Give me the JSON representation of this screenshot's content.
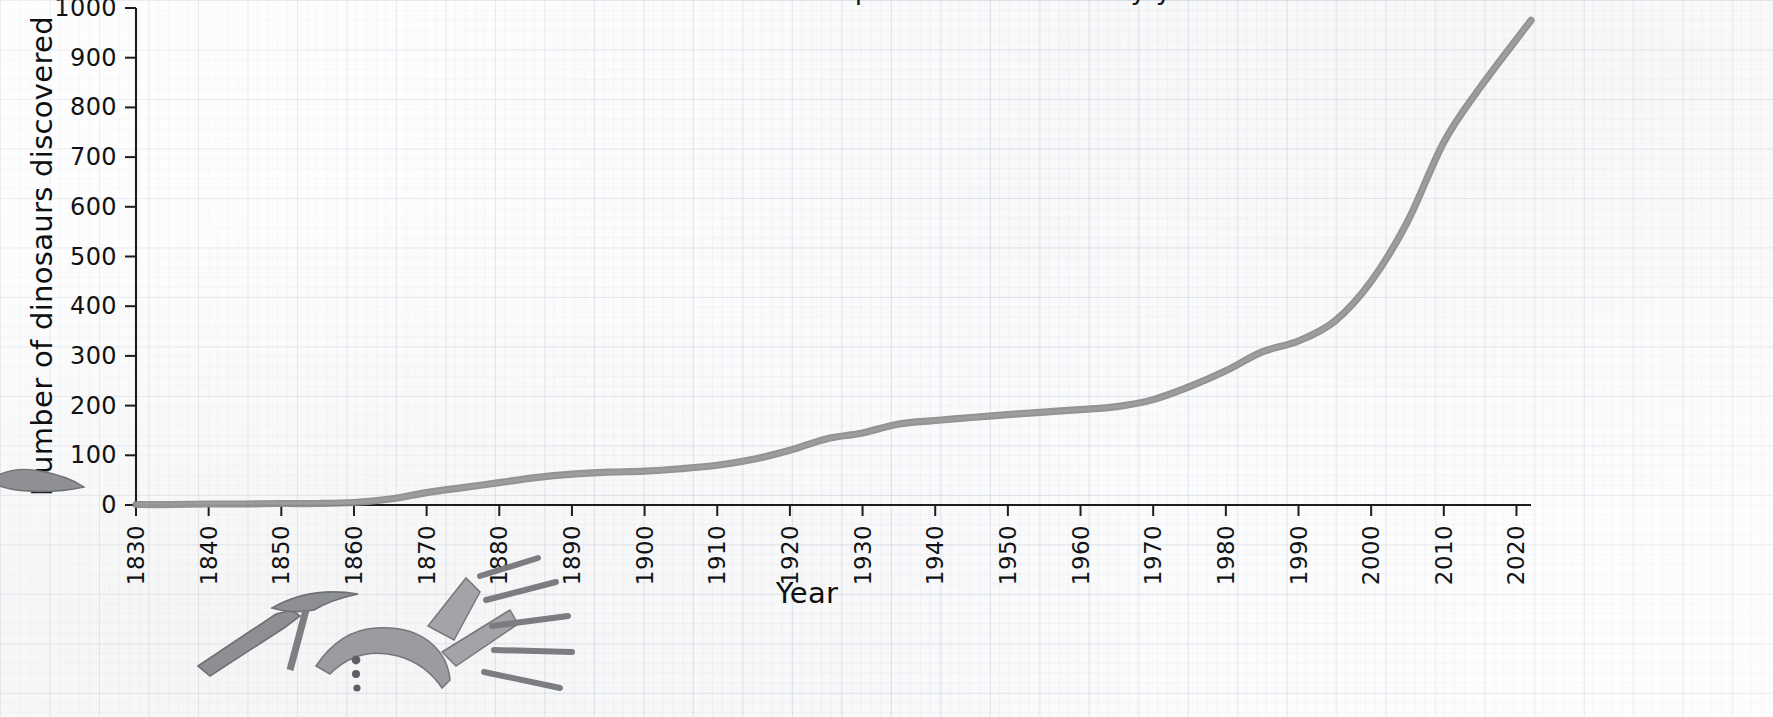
{
  "figure": {
    "title_cutoff": "Number of dinosaur species discovered by year",
    "background": "graph-paper",
    "line_color": "#8b8b8b",
    "text_color": "#111214"
  },
  "axes": {
    "x_title": "Year",
    "y_title": "Number of dinosaurs discovered",
    "x_ticks": [
      "1830",
      "1840",
      "1850",
      "1860",
      "1870",
      "1880",
      "1890",
      "1900",
      "1910",
      "1920",
      "1930",
      "1940",
      "1950",
      "1960",
      "1970",
      "1980",
      "1990",
      "2000",
      "2010",
      "2020"
    ],
    "y_ticks": [
      "0",
      "100",
      "200",
      "300",
      "400",
      "500",
      "600",
      "700",
      "800",
      "900",
      "1000"
    ]
  },
  "decor": {
    "fossil_label": "dinosaur-skeleton-and-pickaxe-illustration",
    "edge_fragment_label": "bone-fragment-illustration"
  },
  "chart_data": {
    "type": "line",
    "title": "Number of dinosaur species discovered by year",
    "xlabel": "Year",
    "ylabel": "Number of dinosaurs discovered",
    "xlim": [
      1830,
      2022
    ],
    "ylim": [
      0,
      1000
    ],
    "grid": true,
    "legend": "none",
    "x": [
      1830,
      1835,
      1840,
      1845,
      1850,
      1855,
      1860,
      1865,
      1870,
      1875,
      1880,
      1885,
      1890,
      1895,
      1900,
      1905,
      1910,
      1915,
      1920,
      1925,
      1930,
      1935,
      1940,
      1945,
      1950,
      1955,
      1960,
      1965,
      1970,
      1975,
      1980,
      1985,
      1990,
      1995,
      2000,
      2005,
      2010,
      2015,
      2022
    ],
    "values": [
      1,
      1,
      2,
      2,
      3,
      3,
      5,
      12,
      25,
      35,
      45,
      55,
      62,
      66,
      68,
      73,
      80,
      92,
      110,
      133,
      145,
      163,
      170,
      176,
      182,
      187,
      192,
      198,
      212,
      238,
      270,
      308,
      330,
      370,
      450,
      570,
      730,
      840,
      975
    ],
    "series": [
      {
        "name": "Cumulative dinosaur species discovered",
        "values": [
          1,
          1,
          2,
          2,
          3,
          3,
          5,
          12,
          25,
          35,
          45,
          55,
          62,
          66,
          68,
          73,
          80,
          92,
          110,
          133,
          145,
          163,
          170,
          176,
          182,
          187,
          192,
          198,
          212,
          238,
          270,
          308,
          330,
          370,
          450,
          570,
          730,
          840,
          975
        ]
      }
    ]
  }
}
